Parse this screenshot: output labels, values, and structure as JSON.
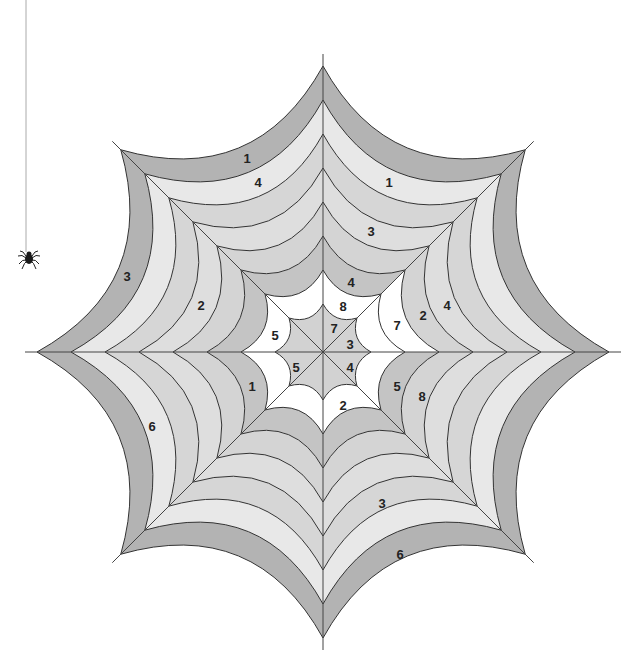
{
  "worksheet": {
    "type": "color-by-number spider web",
    "center": [
      323,
      352
    ],
    "spoke_angles_deg": [
      0,
      45,
      90,
      135,
      180,
      225,
      270,
      315
    ],
    "ring_radii": [
      48,
      82,
      116,
      150,
      184,
      218,
      252,
      286
    ],
    "spoke_extension": 12,
    "band_fills": [
      "#d2d2d2",
      "#ffffff",
      "#c4c4c4",
      "#d4d4d4",
      "#dedede",
      "#d6d6d6",
      "#e8e8e8",
      "#fafafa",
      "#b3b3b3"
    ],
    "sector_band_overrides": [
      {
        "sector": 0,
        "band": 2,
        "fill": "#ffffff"
      },
      {
        "sector": 7,
        "band": 1,
        "fill": "#ffffff"
      },
      {
        "sector": 7,
        "band": 2,
        "fill": "#c4c4c4"
      }
    ],
    "line_color": "#333333"
  },
  "labels": [
    {
      "text": "1",
      "x": 247,
      "y": 158
    },
    {
      "text": "4",
      "x": 258,
      "y": 182
    },
    {
      "text": "1",
      "x": 389,
      "y": 182
    },
    {
      "text": "3",
      "x": 371,
      "y": 231
    },
    {
      "text": "3",
      "x": 127,
      "y": 276
    },
    {
      "text": "4",
      "x": 351,
      "y": 282
    },
    {
      "text": "2",
      "x": 201,
      "y": 305
    },
    {
      "text": "8",
      "x": 343,
      "y": 306
    },
    {
      "text": "4",
      "x": 447,
      "y": 305
    },
    {
      "text": "2",
      "x": 423,
      "y": 315
    },
    {
      "text": "7",
      "x": 397,
      "y": 325
    },
    {
      "text": "5",
      "x": 275,
      "y": 335
    },
    {
      "text": "7",
      "x": 334,
      "y": 328
    },
    {
      "text": "3",
      "x": 350,
      "y": 344
    },
    {
      "text": "5",
      "x": 296,
      "y": 367
    },
    {
      "text": "4",
      "x": 350,
      "y": 367
    },
    {
      "text": "1",
      "x": 252,
      "y": 386
    },
    {
      "text": "5",
      "x": 397,
      "y": 386
    },
    {
      "text": "8",
      "x": 422,
      "y": 396
    },
    {
      "text": "2",
      "x": 343,
      "y": 405
    },
    {
      "text": "6",
      "x": 152,
      "y": 426
    },
    {
      "text": "3",
      "x": 382,
      "y": 503
    },
    {
      "text": "6",
      "x": 400,
      "y": 554
    }
  ],
  "spider": {
    "thread_x": 26,
    "thread_top": 0,
    "thread_bottom": 252,
    "body_x": 29,
    "body_y": 258
  }
}
